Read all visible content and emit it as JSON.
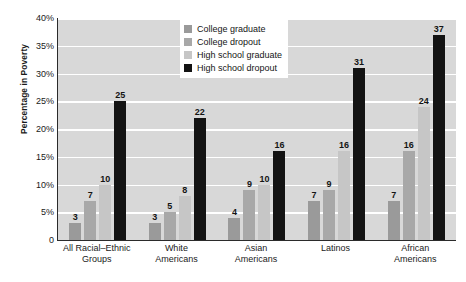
{
  "chart_data": {
    "type": "bar",
    "title": "",
    "xlabel": "",
    "ylabel": "Percentage in Poverty",
    "ylim": [
      0,
      40
    ],
    "ytick_labels": [
      "40%",
      "35%",
      "30%",
      "25%",
      "20%",
      "15%",
      "10%",
      "5%",
      "0"
    ],
    "ytick_values": [
      40,
      35,
      30,
      25,
      20,
      15,
      10,
      5,
      0
    ],
    "grid": true,
    "grid_color": "#ffffff",
    "plot_background": "#d8d8d8",
    "legend_position": "top-center",
    "categories": [
      "All Racial–Ethnic Groups",
      "White Americans",
      "Asian Americans",
      "Latinos",
      "African Americans"
    ],
    "category_lines": [
      [
        "All Racial–Ethnic",
        "Groups"
      ],
      [
        "White",
        "Americans"
      ],
      [
        "Asian",
        "Americans"
      ],
      [
        "Latinos",
        ""
      ],
      [
        "African",
        "Americans"
      ]
    ],
    "series": [
      {
        "name": "College graduate",
        "color": "#9a9a9a",
        "values": [
          3,
          3,
          4,
          7,
          7
        ]
      },
      {
        "name": "College dropout",
        "color": "#a8a8a8",
        "values": [
          7,
          5,
          9,
          9,
          16
        ]
      },
      {
        "name": "High school graduate",
        "color": "#c6c6c6",
        "values": [
          10,
          8,
          10,
          16,
          24
        ]
      },
      {
        "name": "High school dropout",
        "color": "#131313",
        "values": [
          25,
          22,
          16,
          31,
          37
        ]
      }
    ]
  },
  "legend": {
    "items": [
      {
        "label": "College graduate",
        "swatch": "#9a9a9a"
      },
      {
        "label": "College dropout",
        "swatch": "#a8a8a8"
      },
      {
        "label": "High school graduate",
        "swatch": "#c6c6c6"
      },
      {
        "label": "High school dropout",
        "swatch": "#131313"
      }
    ]
  }
}
